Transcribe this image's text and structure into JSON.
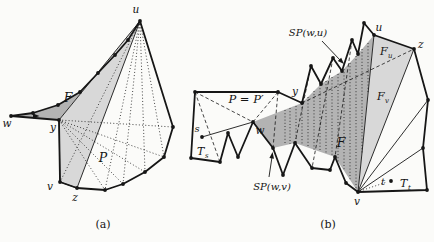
{
  "figure": {
    "background": "#fbfbf9",
    "colors": {
      "funnel_dark": "#b3b3b3",
      "funnel_light": "#d8d8d8",
      "line": "#161616"
    },
    "panel_a": {
      "caption": "(a)",
      "labels": {
        "u": "u",
        "w": "w",
        "y": "y",
        "v": "v",
        "z": "z",
        "funnel": "F",
        "polygon": "P"
      }
    },
    "panel_b": {
      "caption": "(b)",
      "labels": {
        "sp_wu": "SP(w,u)",
        "sp_wv": "SP(w,v)",
        "p_equals": "P = P′",
        "u": "u",
        "z": "z",
        "v": "v",
        "w": "w",
        "y": "y",
        "s": "s",
        "t": "t",
        "funnel": "F",
        "fu_base": "F",
        "fu_sub": "u",
        "fv_base": "F",
        "fv_sub": "v",
        "ts_base": "T",
        "ts_sub": "s",
        "tt_base": "T",
        "tt_sub": "t"
      }
    }
  }
}
